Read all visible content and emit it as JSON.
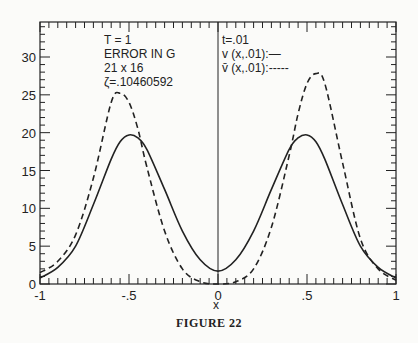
{
  "figure": {
    "caption": "FIGURE 22",
    "annotations_left": [
      "T = 1",
      "ERROR IN G",
      "21 x 16",
      "ζ=.10460592"
    ],
    "annotations_right": [
      "t=.01",
      "v (x,.01):—",
      "v̄ (x,.01):-----"
    ]
  },
  "chart_data": {
    "type": "line",
    "title": "",
    "xlabel": "x",
    "ylabel": "",
    "xlim": [
      -1,
      1
    ],
    "ylim": [
      0,
      34
    ],
    "grid": false,
    "x_ticks": [
      "-1",
      "-.5",
      "0",
      ".5",
      "1"
    ],
    "y_ticks": [
      "0",
      "5",
      "10",
      "15",
      "20",
      "25",
      "30"
    ],
    "legend": {
      "position": "top-right-inside",
      "entries": [
        "v (x,.01): solid",
        "v̄ (x,.01): dashed"
      ]
    },
    "annotations": [
      "T = 1",
      "ERROR IN G",
      "21 x 16",
      "ζ=.10460592",
      "t=.01"
    ],
    "x": [
      -1.0,
      -0.9,
      -0.8,
      -0.7,
      -0.6,
      -0.55,
      -0.5,
      -0.45,
      -0.4,
      -0.3,
      -0.2,
      -0.1,
      0.0,
      0.1,
      0.2,
      0.3,
      0.4,
      0.45,
      0.5,
      0.55,
      0.6,
      0.7,
      0.8,
      0.9,
      1.0
    ],
    "series": [
      {
        "name": "v (x,.01)",
        "style": "solid",
        "values": [
          0.8,
          2.2,
          5.0,
          10.5,
          16.5,
          18.8,
          19.7,
          19.3,
          17.8,
          12.5,
          7.0,
          3.2,
          1.7,
          3.2,
          7.0,
          12.5,
          17.8,
          19.3,
          19.7,
          18.8,
          16.5,
          10.5,
          5.0,
          2.2,
          0.8
        ]
      },
      {
        "name": "v̄ (x,.01)",
        "style": "dashed",
        "values": [
          1.5,
          3.0,
          6.5,
          14.0,
          24.0,
          25.2,
          24.0,
          20.5,
          15.5,
          7.0,
          2.0,
          0.3,
          0.0,
          0.3,
          2.0,
          7.5,
          17.0,
          22.5,
          26.5,
          27.8,
          26.5,
          16.0,
          6.0,
          2.0,
          0.5
        ]
      }
    ],
    "vertical_line_at_x": 0
  }
}
